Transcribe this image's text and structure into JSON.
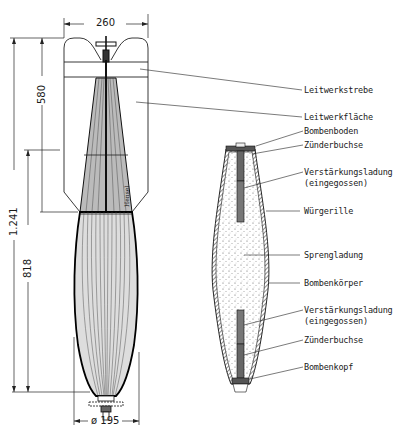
{
  "diagram": {
    "dimensions": {
      "tail_width": "260",
      "tail_length": "580",
      "overall_length": "1.241",
      "body_length": "818",
      "diameter": "ø 195"
    },
    "body_marking": "Hensel",
    "labels": [
      {
        "id": "leitwerkstrebe",
        "text": "Leitwerkstrebe"
      },
      {
        "id": "leitwerkflaeche",
        "text": "Leitwerkfläche"
      },
      {
        "id": "bombenboden",
        "text": "Bombenboden"
      },
      {
        "id": "zuenderbuchse-top",
        "text": "Zünderbuchse"
      },
      {
        "id": "verstaerkung-top-1",
        "text": "Verstärkungsladung"
      },
      {
        "id": "verstaerkung-top-2",
        "text": "(eingegossen)"
      },
      {
        "id": "wuergerille",
        "text": "Würgerille"
      },
      {
        "id": "sprengladung",
        "text": "Sprengladung"
      },
      {
        "id": "bombenkoerper",
        "text": "Bombenkörper"
      },
      {
        "id": "verstaerkung-bot-1",
        "text": "Verstärkungsladung"
      },
      {
        "id": "verstaerkung-bot-2",
        "text": "(eingegossen)"
      },
      {
        "id": "zuenderbuchse-bot",
        "text": "Zünderbuchse"
      },
      {
        "id": "bombenkopf",
        "text": "Bombenkopf"
      }
    ]
  }
}
